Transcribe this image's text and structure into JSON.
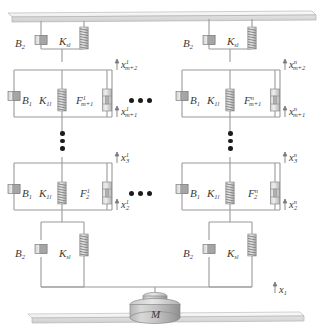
{
  "figure": {
    "type": "mechanical-network-schematic",
    "colors": {
      "line": "#9a9a9a",
      "line_dark": "#7d7d7d",
      "text": "#3a3a3a",
      "dot": "#1b1b1b",
      "metal_light": "#f2f2f2",
      "metal_mid": "#c9c9c9",
      "metal_dark": "#9e9e9e"
    }
  },
  "columns": [
    {
      "id": "col-1",
      "superscript": "1",
      "top_stage": {
        "damper_label_base": "B",
        "damper_label_sub": "2",
        "spring_label_base": "K",
        "spring_label_sub": "sl"
      },
      "upper_stage": {
        "damper_label_base": "B",
        "damper_label_sub": "1",
        "spring_label_base": "K",
        "spring_label_sub": "1l",
        "force_label_base": "F",
        "force_label_sub": "m+1",
        "force_label_sup": "1"
      },
      "lower_stage": {
        "damper_label_base": "B",
        "damper_label_sub": "1",
        "spring_label_base": "K",
        "spring_label_sub": "1l",
        "force_label_base": "F",
        "force_label_sub": "2",
        "force_label_sup": "1"
      },
      "bottom_stage": {
        "damper_label_base": "B",
        "damper_label_sub": "2",
        "spring_label_base": "K",
        "spring_label_sub": "sl"
      },
      "displacements": [
        {
          "base": "x",
          "sub": "m+2",
          "sup": "1"
        },
        {
          "base": "x",
          "sub": "m+1",
          "sup": "1"
        },
        {
          "base": "x",
          "sub": "3",
          "sup": "1"
        },
        {
          "base": "x",
          "sub": "2",
          "sup": "1"
        }
      ]
    },
    {
      "id": "col-n",
      "superscript": "n",
      "top_stage": {
        "damper_label_base": "B",
        "damper_label_sub": "2",
        "spring_label_base": "K",
        "spring_label_sub": "sl"
      },
      "upper_stage": {
        "damper_label_base": "B",
        "damper_label_sub": "1",
        "spring_label_base": "K",
        "spring_label_sub": "1l",
        "force_label_base": "F",
        "force_label_sub": "m+1",
        "force_label_sup": "n"
      },
      "lower_stage": {
        "damper_label_base": "B",
        "damper_label_sub": "1",
        "spring_label_base": "K",
        "spring_label_sub": "1l",
        "force_label_base": "F",
        "force_label_sub": "2",
        "force_label_sup": "n"
      },
      "bottom_stage": {
        "damper_label_base": "B",
        "damper_label_sub": "2",
        "spring_label_base": "K",
        "spring_label_sub": "sl"
      },
      "displacements": [
        {
          "base": "x",
          "sub": "m+2",
          "sup": "n"
        },
        {
          "base": "x",
          "sub": "m+1",
          "sup": "n"
        },
        {
          "base": "x",
          "sub": "3",
          "sup": "n"
        },
        {
          "base": "x",
          "sub": "2",
          "sup": "n"
        }
      ]
    }
  ],
  "mass": {
    "label": "M"
  },
  "base_displacement": {
    "base": "x",
    "sub": "1"
  },
  "ellipsis": {
    "horizontal_count": 3,
    "vertical_count": 3
  }
}
